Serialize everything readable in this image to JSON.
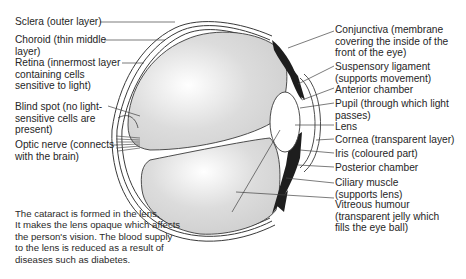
{
  "diagram": {
    "left_labels": [
      {
        "id": "sclera",
        "text": "Sclera (outer layer)"
      },
      {
        "id": "choroid",
        "text": "Choroid (thin middle\nlayer)"
      },
      {
        "id": "retina",
        "text": "Retina (innermost layer\ncontaining cells\nsensitive to light)"
      },
      {
        "id": "blind-spot",
        "text": "Blind spot (no light-\nsensitive cells are\npresent)"
      },
      {
        "id": "optic-nerve",
        "text": "Optic nerve (connects\nwith the brain)"
      }
    ],
    "right_labels": [
      {
        "id": "conjunctiva",
        "text": "Conjunctiva (membrane\ncovering the inside of the\nfront of the eye)"
      },
      {
        "id": "suspensory-ligament",
        "text": "Suspensory ligament\n(supports movement)"
      },
      {
        "id": "anterior-chamber",
        "text": "Anterior chamber"
      },
      {
        "id": "pupil",
        "text": "Pupil (through which light\npasses)"
      },
      {
        "id": "lens",
        "text": "Lens"
      },
      {
        "id": "cornea",
        "text": "Cornea (transparent layer)"
      },
      {
        "id": "iris",
        "text": "Iris (coloured part)"
      },
      {
        "id": "posterior-chamber",
        "text": "Posterior chamber"
      },
      {
        "id": "ciliary-muscle",
        "text": "Ciliary muscle\n(supports lens)"
      },
      {
        "id": "vitreous-humour",
        "text": "Vitreous humour\n(transparent jelly which\nfills the eye ball)"
      }
    ],
    "cataract_note": "The cataract is formed in the lens.\nIt makes the lens opaque which affects\nthe person's vision.  The blood supply\nto the lens is reduced as a result of\ndiseases such as diabetes.",
    "colors": {
      "outline": "#3a3a3a",
      "humour_fill": "#d9d9d9",
      "muscle_fill": "#1e1e1e",
      "background": "#ffffff"
    }
  }
}
